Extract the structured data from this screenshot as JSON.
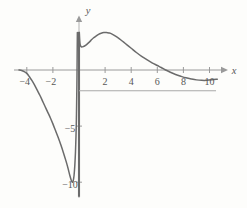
{
  "figure": {
    "background_color": "#fdfdfb",
    "curve_color": "#6b6b6b",
    "axis_color": "#9a9a9a",
    "label_color": "#575757",
    "rule_color": "#a8a8a8"
  },
  "chart_data": {
    "type": "line",
    "title": "",
    "subtitle": "",
    "xlabel": "x",
    "ylabel": "y",
    "xlim": [
      -5.2,
      11.4
    ],
    "ylim": [
      -11.6,
      5.2
    ],
    "grid": false,
    "legend": null,
    "annotations": [],
    "axes": {
      "x_axis": {
        "name": "x",
        "tick_values": [
          -4,
          -2,
          2,
          4,
          6,
          8,
          10
        ],
        "tick_labels": [
          "−4",
          "−2",
          "2",
          "4",
          "6",
          "8",
          "10"
        ],
        "arrow": true
      },
      "y_axis": {
        "name": "y",
        "tick_values": [
          -5,
          -10
        ],
        "tick_labels": [
          "−5",
          "−10"
        ],
        "arrow": true
      }
    },
    "series": [
      {
        "name": "branch-left",
        "comment": "left branch: rises from x=-4.6 at y=0, falls to minimum near (-0.55,-10), then rises steeply toward the vertical asymptote at x=0",
        "points": [
          [
            -4.6,
            0.0
          ],
          [
            -4.4,
            -0.05
          ],
          [
            -4.2,
            -0.15
          ],
          [
            -4.0,
            -0.3
          ],
          [
            -3.8,
            -0.6
          ],
          [
            -3.6,
            -0.95
          ],
          [
            -3.4,
            -1.35
          ],
          [
            -3.2,
            -1.8
          ],
          [
            -3.0,
            -2.25
          ],
          [
            -2.8,
            -2.75
          ],
          [
            -2.6,
            -3.25
          ],
          [
            -2.4,
            -3.75
          ],
          [
            -2.2,
            -4.25
          ],
          [
            -2.0,
            -4.8
          ],
          [
            -1.8,
            -5.4
          ],
          [
            -1.6,
            -6.0
          ],
          [
            -1.4,
            -6.65
          ],
          [
            -1.2,
            -7.35
          ],
          [
            -1.0,
            -8.1
          ],
          [
            -0.9,
            -8.5
          ],
          [
            -0.8,
            -8.95
          ],
          [
            -0.7,
            -9.4
          ],
          [
            -0.6,
            -9.8
          ],
          [
            -0.52,
            -10.0
          ],
          [
            -0.45,
            -9.9
          ],
          [
            -0.38,
            -9.4
          ],
          [
            -0.32,
            -8.5
          ],
          [
            -0.27,
            -7.3
          ],
          [
            -0.23,
            -5.9
          ],
          [
            -0.2,
            -4.4
          ],
          [
            -0.18,
            -2.9
          ],
          [
            -0.16,
            -1.2
          ],
          [
            -0.15,
            0.0
          ],
          [
            -0.14,
            1.4
          ],
          [
            -0.13,
            2.6
          ],
          [
            -0.125,
            3.35
          ]
        ]
      },
      {
        "name": "branch-right",
        "comment": "right branch: drops from high near x=0+, peaks about 3.3 near x=2, crosses zero near x=6.6, shallow minimum near x=9.6",
        "points": [
          [
            0.02,
            3.35
          ],
          [
            0.06,
            2.55
          ],
          [
            0.1,
            2.2
          ],
          [
            0.2,
            2.05
          ],
          [
            0.35,
            2.1
          ],
          [
            0.5,
            2.2
          ],
          [
            0.7,
            2.4
          ],
          [
            0.9,
            2.62
          ],
          [
            1.1,
            2.85
          ],
          [
            1.3,
            3.02
          ],
          [
            1.5,
            3.18
          ],
          [
            1.7,
            3.28
          ],
          [
            1.9,
            3.34
          ],
          [
            2.1,
            3.35
          ],
          [
            2.3,
            3.3
          ],
          [
            2.5,
            3.22
          ],
          [
            2.8,
            3.02
          ],
          [
            3.1,
            2.78
          ],
          [
            3.4,
            2.5
          ],
          [
            3.7,
            2.22
          ],
          [
            4.0,
            1.94
          ],
          [
            4.4,
            1.56
          ],
          [
            4.8,
            1.22
          ],
          [
            5.2,
            0.92
          ],
          [
            5.6,
            0.64
          ],
          [
            6.0,
            0.4
          ],
          [
            6.3,
            0.22
          ],
          [
            6.6,
            0.02
          ],
          [
            7.0,
            -0.2
          ],
          [
            7.4,
            -0.4
          ],
          [
            7.8,
            -0.56
          ],
          [
            8.2,
            -0.7
          ],
          [
            8.6,
            -0.8
          ],
          [
            9.0,
            -0.88
          ],
          [
            9.4,
            -0.92
          ],
          [
            9.8,
            -0.92
          ],
          [
            10.2,
            -0.88
          ],
          [
            10.6,
            -0.82
          ]
        ]
      }
    ],
    "extra_elements": [
      {
        "name": "vertical-asymptote",
        "type": "vertical-line",
        "x": 0,
        "y_from": -11.3,
        "y_to": 3.4
      },
      {
        "name": "horizontal-rule",
        "type": "horizontal-line",
        "y": -1.85,
        "x_from": 0,
        "x_to": 10.5
      }
    ]
  }
}
